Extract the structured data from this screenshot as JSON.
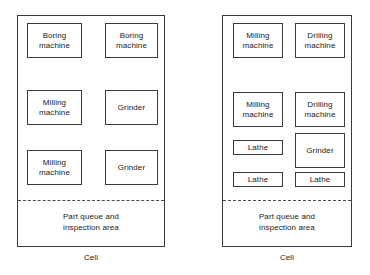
{
  "diagram": {
    "colors": {
      "line": "#3a3a3a",
      "dashed_line": "#4a4a4a",
      "text": "#1a1a1a",
      "background": "#ffffff"
    }
  },
  "cells": [
    {
      "id": "cell-left",
      "caption": "Cell",
      "queue_label": {
        "line1": "Part queue and",
        "line2": "inspection area"
      },
      "machines": [
        {
          "id": "boring-machine-1",
          "line1": "Boring",
          "line2": "machine",
          "column": "left",
          "row": 1
        },
        {
          "id": "boring-machine-2",
          "line1": "Boring",
          "line2": "machine",
          "column": "right",
          "row": 1
        },
        {
          "id": "milling-machine-1",
          "line1": "Milling",
          "line2": "machine",
          "column": "left",
          "row": 2
        },
        {
          "id": "grinder-1",
          "line1": "Grinder",
          "line2": "",
          "column": "right",
          "row": 2
        },
        {
          "id": "milling-machine-2",
          "line1": "Milling",
          "line2": "machine",
          "column": "left",
          "row": 3
        },
        {
          "id": "grinder-2",
          "line1": "Grinder",
          "line2": "",
          "column": "right",
          "row": 3
        }
      ]
    },
    {
      "id": "cell-right",
      "caption": "Cell",
      "queue_label": {
        "line1": "Part queue and",
        "line2": "inspection area"
      },
      "machines": [
        {
          "id": "milling-machine-3",
          "line1": "Milling",
          "line2": "machine",
          "column": "left",
          "row": 1
        },
        {
          "id": "drilling-machine-1",
          "line1": "Drilling",
          "line2": "machine",
          "column": "right",
          "row": 1
        },
        {
          "id": "milling-machine-4",
          "line1": "Milling",
          "line2": "machine",
          "column": "left",
          "row": 2
        },
        {
          "id": "drilling-machine-2",
          "line1": "Drilling",
          "line2": "machine",
          "column": "right",
          "row": 2
        },
        {
          "id": "lathe-1",
          "line1": "Lathe",
          "line2": "",
          "column": "left",
          "row": 3
        },
        {
          "id": "grinder-3",
          "line1": "Grinder",
          "line2": "",
          "column": "right",
          "row": 3
        },
        {
          "id": "lathe-2",
          "line1": "Lathe",
          "line2": "",
          "column": "left",
          "row": 4
        },
        {
          "id": "lathe-3",
          "line1": "Lathe",
          "line2": "",
          "column": "right",
          "row": 4
        }
      ]
    }
  ]
}
